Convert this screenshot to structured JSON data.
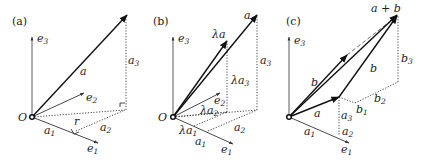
{
  "figure": {
    "panels": [
      {
        "id": "a",
        "label": "(a)",
        "origin": "O",
        "axes": {
          "e1": "e",
          "e1_sub": "1",
          "e2": "e",
          "e2_sub": "2",
          "e3": "e",
          "e3_sub": "3"
        },
        "vector": "a",
        "components": {
          "a1": "a",
          "a1_sub": "1",
          "a2": "a",
          "a2_sub": "2",
          "a3": "a",
          "a3_sub": "3"
        },
        "projection": "r"
      },
      {
        "id": "b",
        "label": "(b)",
        "origin": "O",
        "axes": {
          "e1": "e",
          "e1_sub": "1",
          "e2": "e",
          "e2_sub": "2",
          "e3": "e",
          "e3_sub": "3"
        },
        "vector": "a",
        "scaled_vector": "λa",
        "components": {
          "a1": "a",
          "a1_sub": "1",
          "a2": "a",
          "a2_sub": "2",
          "a3": "a",
          "a3_sub": "3"
        },
        "scaled_components": {
          "la1": "λa",
          "la1_sub": "1",
          "la2": "λa",
          "la2_sub": "2",
          "la3": "λa",
          "la3_sub": "3"
        }
      },
      {
        "id": "c",
        "label": "(c)",
        "origin": "O",
        "axes": {
          "e1": "e",
          "e1_sub": "1",
          "e3": "e",
          "e3_sub": "3"
        },
        "vector_a": "a",
        "vector_b": "b",
        "vector_b_translated": "b",
        "sum": "a + b",
        "components_a": {
          "a1": "a",
          "a1_sub": "1",
          "a2": "a",
          "a2_sub": "2",
          "a3": "a",
          "a3_sub": "3"
        },
        "components_b": {
          "b1": "b",
          "b1_sub": "1",
          "b2": "b",
          "b2_sub": "2",
          "b3": "b",
          "b3_sub": "3"
        }
      }
    ]
  }
}
